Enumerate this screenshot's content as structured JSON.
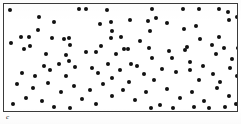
{
  "figure": {
    "label": "c",
    "label_x": 6,
    "label_y": 114,
    "label_size": 7,
    "background": "#ffffff"
  },
  "frame": {
    "x": 3,
    "y": 3,
    "width": 235,
    "height": 109,
    "border_width": 1,
    "border_color": "#3a3a3a",
    "fill": "#ffffff"
  },
  "chart_data": {
    "type": "scatter",
    "title": "",
    "subtitle": "",
    "xlabel": "",
    "ylabel": "",
    "xlim": [
      0,
      235
    ],
    "ylim": [
      0,
      109
    ],
    "grid": false,
    "legend": null,
    "annotations": [
      "c"
    ],
    "marker": {
      "shape": "circle",
      "color": "#111111",
      "size_px": 4,
      "edge_color": "#111111"
    },
    "point_count": 112,
    "series": [
      {
        "name": "points",
        "color": "#111111",
        "points": [
          [
            6,
            6
          ],
          [
            35,
            13
          ],
          [
            50,
            18
          ],
          [
            34,
            26
          ],
          [
            75,
            5
          ],
          [
            82,
            5
          ],
          [
            103,
            6
          ],
          [
            96,
            20
          ],
          [
            107,
            18
          ],
          [
            108,
            27
          ],
          [
            148,
            5
          ],
          [
            179,
            5
          ],
          [
            126,
            16
          ],
          [
            144,
            17
          ],
          [
            152,
            14
          ],
          [
            163,
            19
          ],
          [
            146,
            27
          ],
          [
            180,
            25
          ],
          [
            195,
            5
          ],
          [
            215,
            5
          ],
          [
            224,
            8
          ],
          [
            225,
            16
          ],
          [
            192,
            22
          ],
          [
            233,
            13
          ],
          [
            17,
            33
          ],
          [
            25,
            33
          ],
          [
            48,
            34
          ],
          [
            60,
            35
          ],
          [
            7,
            39
          ],
          [
            26,
            42
          ],
          [
            42,
            50
          ],
          [
            62,
            51
          ],
          [
            20,
            45
          ],
          [
            65,
            34
          ],
          [
            107,
            34
          ],
          [
            117,
            33
          ],
          [
            66,
            41
          ],
          [
            97,
            42
          ],
          [
            120,
            45
          ],
          [
            82,
            48
          ],
          [
            92,
            48
          ],
          [
            112,
            50
          ],
          [
            65,
            57
          ],
          [
            124,
            45
          ],
          [
            145,
            44
          ],
          [
            165,
            47
          ],
          [
            181,
            46
          ],
          [
            148,
            54
          ],
          [
            168,
            54
          ],
          [
            127,
            60
          ],
          [
            136,
            37
          ],
          [
            196,
            35
          ],
          [
            215,
            33
          ],
          [
            183,
            43
          ],
          [
            208,
            41
          ],
          [
            220,
            44
          ],
          [
            234,
            44
          ],
          [
            212,
            50
          ],
          [
            186,
            58
          ],
          [
            228,
            55
          ],
          [
            40,
            62
          ],
          [
            46,
            66
          ],
          [
            18,
            69
          ],
          [
            31,
            72
          ],
          [
            55,
            60
          ],
          [
            71,
            63
          ],
          [
            88,
            64
          ],
          [
            94,
            69
          ],
          [
            62,
            72
          ],
          [
            104,
            60
          ],
          [
            116,
            66
          ],
          [
            133,
            62
          ],
          [
            140,
            70
          ],
          [
            158,
            65
          ],
          [
            172,
            68
          ],
          [
            150,
            76
          ],
          [
            125,
            78
          ],
          [
            108,
            74
          ],
          [
            186,
            66
          ],
          [
            199,
            62
          ],
          [
            209,
            70
          ],
          [
            226,
            64
          ],
          [
            233,
            72
          ],
          [
            195,
            76
          ],
          [
            216,
            78
          ],
          [
            13,
            80
          ],
          [
            29,
            84
          ],
          [
            44,
            79
          ],
          [
            57,
            88
          ],
          [
            22,
            94
          ],
          [
            38,
            97
          ],
          [
            9,
            100
          ],
          [
            50,
            103
          ],
          [
            70,
            82
          ],
          [
            86,
            86
          ],
          [
            99,
            80
          ],
          [
            78,
            95
          ],
          [
            92,
            100
          ],
          [
            66,
            104
          ],
          [
            108,
            92
          ],
          [
            119,
            86
          ],
          [
            131,
            96
          ],
          [
            142,
            88
          ],
          [
            156,
            101
          ],
          [
            147,
            104
          ],
          [
            163,
            85
          ],
          [
            176,
            94
          ],
          [
            169,
            104
          ],
          [
            188,
            88
          ],
          [
            200,
            97
          ],
          [
            213,
            84
          ],
          [
            225,
            92
          ],
          [
            232,
            100
          ],
          [
            205,
            104
          ],
          [
            190,
            103
          ],
          [
            221,
            103
          ]
        ]
      }
    ]
  }
}
